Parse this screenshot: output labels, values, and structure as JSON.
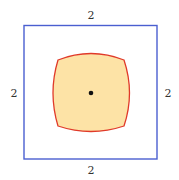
{
  "diagram": {
    "outer_square": {
      "color": "#4a5fd0",
      "side_labels": {
        "top": "2",
        "bottom": "2",
        "left": "2",
        "right": "2"
      }
    },
    "inner_region": {
      "fill": "#fde3a6",
      "stroke": "#e03a2a",
      "shape": "curved square (bulging sides)"
    },
    "center_point": {
      "color": "#111111"
    }
  }
}
